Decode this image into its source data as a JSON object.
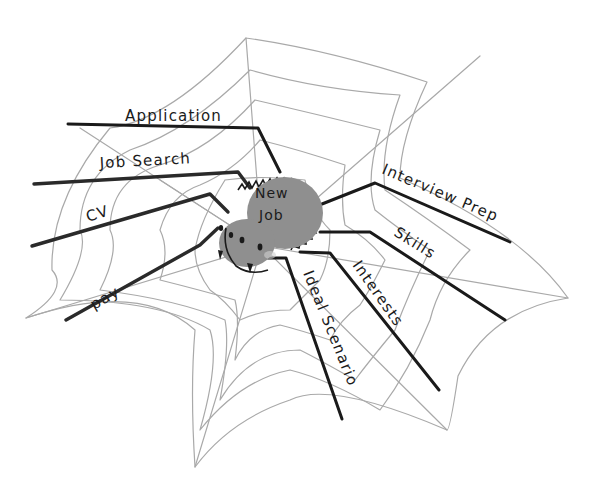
{
  "diagram": {
    "type": "spider mind map",
    "center": {
      "label_line1": "New",
      "label_line2": "Job"
    },
    "branches": [
      {
        "id": "application",
        "label": "Application"
      },
      {
        "id": "job-search",
        "label": "Job Search"
      },
      {
        "id": "cv",
        "label": "CV"
      },
      {
        "id": "pay",
        "label": "pay"
      },
      {
        "id": "interview-prep",
        "label": "Interview Prep"
      },
      {
        "id": "skills",
        "label": "Skills"
      },
      {
        "id": "interests",
        "label": "Interests"
      },
      {
        "id": "ideal-scenario",
        "label": "Ideal Scenario"
      }
    ]
  },
  "colors": {
    "background": "#ffffff",
    "web": "#a9a9a9",
    "legs": "#1a1a1a",
    "body": "#8f8f8f",
    "ink": "#1b1b1b"
  }
}
